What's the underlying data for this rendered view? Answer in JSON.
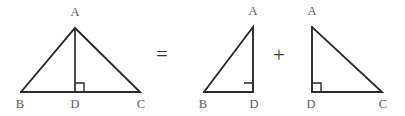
{
  "figure": {
    "background_color": "#ffffff",
    "line_color": "#2b2b2b",
    "label_color": "#5d5d5d",
    "operator_color": "#3a3a3a"
  },
  "shapes": {
    "triangle_abc": {
      "name": "triangle ABC with altitude AD",
      "vertices": {
        "A": {
          "label": "A",
          "x": 75,
          "y": 28,
          "label_x": 75,
          "label_y": 16
        },
        "B": {
          "label": "B",
          "x": 21,
          "y": 92,
          "label_x": 20,
          "label_y": 108
        },
        "C": {
          "label": "C",
          "x": 140,
          "y": 92,
          "label_x": 141,
          "label_y": 108
        },
        "D": {
          "label": "D",
          "x": 75,
          "y": 92,
          "label_x": 75,
          "label_y": 108
        }
      },
      "edges": "21,92 75,28 140,92 21,92",
      "altitude": {
        "x1": 75,
        "y1": 28,
        "x2": 75,
        "y2": 92
      },
      "right_angle_mark": "75,83 84,83 84,92",
      "right_angle_at": "D"
    },
    "triangle_abd": {
      "name": "right triangle ABD",
      "vertices": {
        "A": {
          "label": "A",
          "x": 253,
          "y": 27,
          "label_x": 253,
          "label_y": 15
        },
        "B": {
          "label": "B",
          "x": 204,
          "y": 92,
          "label_x": 203,
          "label_y": 108
        },
        "D": {
          "label": "D",
          "x": 253,
          "y": 92,
          "label_x": 254,
          "label_y": 108
        }
      },
      "edges": "204,92 253,27 253,92 204,92",
      "right_angle_mark": "244,83 253,83 253,92",
      "right_angle_at": "D"
    },
    "triangle_adc": {
      "name": "right triangle ADC",
      "vertices": {
        "A": {
          "label": "A",
          "x": 312,
          "y": 27,
          "label_x": 312,
          "label_y": 15
        },
        "D": {
          "label": "D",
          "x": 312,
          "y": 92,
          "label_x": 311,
          "label_y": 108
        },
        "C": {
          "label": "C",
          "x": 382,
          "y": 92,
          "label_x": 383,
          "label_y": 108
        }
      },
      "edges": "312,27 312,92 382,92 312,27",
      "right_angle_mark": "312,83 321,83 321,92",
      "right_angle_at": "D"
    }
  },
  "operators": {
    "equals": {
      "symbol": "=",
      "x": 162,
      "y": 56
    },
    "plus": {
      "symbol": "+",
      "x": 279,
      "y": 57
    }
  }
}
